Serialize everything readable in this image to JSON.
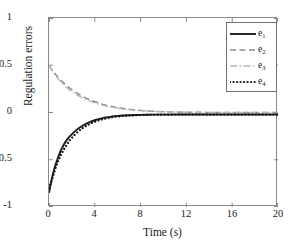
{
  "chart_data": {
    "type": "line",
    "title": "",
    "xlabel": "Time (s)",
    "ylabel": "Regulation errors",
    "xlim": [
      0,
      20
    ],
    "ylim": [
      -1,
      1
    ],
    "xticks": [
      0,
      4,
      8,
      12,
      16,
      20
    ],
    "yticks": [
      1,
      0.5,
      0,
      -0.5,
      -1
    ],
    "xtick_labels": [
      "0",
      "4",
      "8",
      "12",
      "16",
      "20"
    ],
    "ytick_labels": [
      "1",
      "0.5",
      "0",
      "-0.5",
      "-1"
    ],
    "grid": false,
    "legend_position": "upper right",
    "series": [
      {
        "name": "e1",
        "label": "e",
        "subscript": "1",
        "style": "solid",
        "color": "#1c1c1c",
        "width": 1.9,
        "x": [
          0,
          0.25,
          0.5,
          0.75,
          1,
          1.25,
          1.5,
          1.75,
          2,
          2.5,
          3,
          3.5,
          4,
          4.5,
          5,
          5.5,
          6,
          6.5,
          7,
          8,
          9,
          10,
          12,
          14,
          16,
          18,
          20
        ],
        "y": [
          -0.85,
          -0.7,
          -0.58,
          -0.49,
          -0.41,
          -0.35,
          -0.3,
          -0.26,
          -0.23,
          -0.175,
          -0.135,
          -0.105,
          -0.082,
          -0.065,
          -0.052,
          -0.043,
          -0.036,
          -0.032,
          -0.029,
          -0.025,
          -0.023,
          -0.022,
          -0.021,
          -0.021,
          -0.021,
          -0.021,
          -0.021
        ]
      },
      {
        "name": "e2",
        "label": "e",
        "subscript": "2",
        "style": "dashed",
        "color": "#8c8c8c",
        "width": 1.5,
        "x": [
          0,
          0.25,
          0.5,
          0.75,
          1,
          1.5,
          2,
          2.5,
          3,
          3.5,
          4,
          4.5,
          5,
          5.5,
          6,
          6.5,
          7,
          8,
          9,
          10,
          12,
          14,
          16,
          18,
          20
        ],
        "y": [
          0.5,
          0.455,
          0.415,
          0.378,
          0.345,
          0.288,
          0.24,
          0.2,
          0.166,
          0.138,
          0.114,
          0.094,
          0.077,
          0.063,
          0.051,
          0.042,
          0.034,
          0.022,
          0.014,
          0.009,
          0.003,
          0.001,
          0.0,
          0.0,
          0.0
        ]
      },
      {
        "name": "e3",
        "label": "e",
        "subscript": "3",
        "style": "dashdot",
        "color": "#b8b8b8",
        "width": 1.4,
        "x": [
          0,
          0.25,
          0.5,
          0.75,
          1,
          1.5,
          2,
          2.5,
          3,
          3.5,
          4,
          4.5,
          5,
          5.5,
          6,
          6.5,
          7,
          8,
          9,
          10,
          12,
          14,
          16,
          18,
          20
        ],
        "y": [
          0.5,
          0.448,
          0.402,
          0.362,
          0.327,
          0.268,
          0.22,
          0.181,
          0.149,
          0.123,
          0.101,
          0.083,
          0.068,
          0.056,
          0.046,
          0.037,
          0.03,
          0.02,
          0.013,
          0.008,
          0.003,
          0.001,
          0.0,
          0.0,
          0.0
        ]
      },
      {
        "name": "e4",
        "label": "e",
        "subscript": "4",
        "style": "dotted",
        "color": "#141414",
        "width": 2.2,
        "x": [
          0,
          0.25,
          0.5,
          0.75,
          1,
          1.25,
          1.5,
          1.75,
          2,
          2.5,
          3,
          3.5,
          4,
          4.5,
          5,
          5.5,
          6,
          6.5,
          7,
          8,
          9,
          10,
          12,
          14,
          16,
          18,
          20
        ],
        "y": [
          -0.8,
          -0.715,
          -0.615,
          -0.53,
          -0.458,
          -0.4,
          -0.35,
          -0.305,
          -0.268,
          -0.207,
          -0.16,
          -0.125,
          -0.098,
          -0.077,
          -0.062,
          -0.05,
          -0.042,
          -0.036,
          -0.032,
          -0.027,
          -0.024,
          -0.023,
          -0.022,
          -0.022,
          -0.022,
          -0.022,
          -0.022
        ]
      }
    ]
  },
  "axes": {
    "frame_color": "#8a8a8a",
    "background": "#ffffff"
  }
}
